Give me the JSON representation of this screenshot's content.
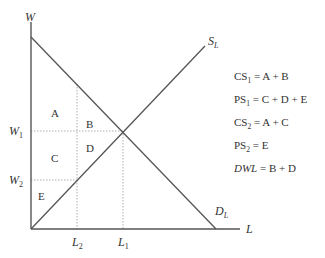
{
  "axes": {
    "y_label": "W",
    "x_label": "L"
  },
  "curves": {
    "supply": {
      "label": "S",
      "sub": "L"
    },
    "demand": {
      "label": "D",
      "sub": "L"
    }
  },
  "ticks": {
    "w1": {
      "label": "W",
      "sub": "1"
    },
    "w2": {
      "label": "W",
      "sub": "2"
    },
    "l1": {
      "label": "L",
      "sub": "1"
    },
    "l2": {
      "label": "L",
      "sub": "2"
    }
  },
  "regions": {
    "A": "A",
    "B": "B",
    "C": "C",
    "D": "D",
    "E": "E"
  },
  "equations": [
    {
      "lhs": "CS",
      "sub": "1",
      "rhs": " = A + B",
      "italic": false
    },
    {
      "lhs": "PS",
      "sub": "1",
      "rhs": " = C + D + E",
      "italic": false
    },
    {
      "lhs": "CS",
      "sub": "2",
      "rhs": " = A + C",
      "italic": false
    },
    {
      "lhs": "PS",
      "sub": "2",
      "rhs": " = E",
      "italic": false
    },
    {
      "lhs": "DWL",
      "sub": "",
      "rhs": " = B + D",
      "italic": true
    }
  ],
  "colors": {
    "line": "#555555",
    "guide": "#9a9a9a",
    "text": "#333333"
  }
}
